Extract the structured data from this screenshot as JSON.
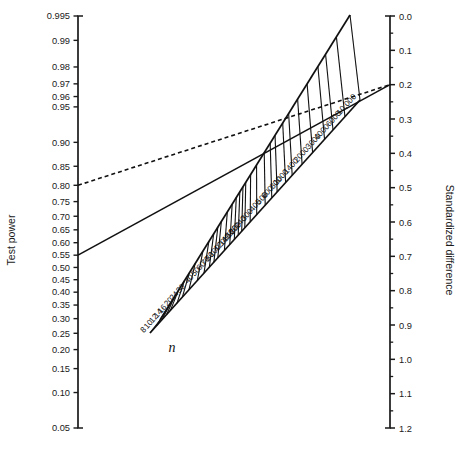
{
  "chart_data": {
    "type": "line",
    "title": "",
    "subtitle": "",
    "left_axis": {
      "label": "Test power",
      "tick_labels": [
        "0.995",
        "0.99",
        "0.98",
        "0.97",
        "0.96",
        "0.95",
        "0.90",
        "0.85",
        "0.80",
        "0.75",
        "0.70",
        "0.65",
        "0.60",
        "0.55",
        "0.50",
        "0.45",
        "0.40",
        "0.35",
        "0.30",
        "0.25",
        "0.20",
        "0.15",
        "0.10",
        "0.05"
      ],
      "tick_values": [
        0.995,
        0.99,
        0.98,
        0.97,
        0.96,
        0.95,
        0.9,
        0.85,
        0.8,
        0.75,
        0.7,
        0.65,
        0.6,
        0.55,
        0.5,
        0.45,
        0.4,
        0.35,
        0.3,
        0.25,
        0.2,
        0.15,
        0.1,
        0.05
      ],
      "range": [
        0.05,
        0.995
      ],
      "scale": "probit"
    },
    "right_axis": {
      "label": "Standardized difference",
      "tick_labels": [
        "0.0",
        "0.1",
        "0.2",
        "0.3",
        "0.4",
        "0.5",
        "0.6",
        "0.7",
        "0.8",
        "0.9",
        "1.0",
        "1.1",
        "1.2"
      ],
      "tick_values": [
        0.0,
        0.1,
        0.2,
        0.3,
        0.4,
        0.5,
        0.6,
        0.7,
        0.8,
        0.9,
        1.0,
        1.1,
        1.2
      ],
      "minor_tick_values": [
        0.05,
        0.15,
        0.25,
        0.35,
        0.45,
        0.55,
        0.65,
        0.75,
        0.85,
        0.95,
        1.05,
        1.15
      ],
      "range": [
        0.0,
        1.2
      ],
      "scale": "linear",
      "direction": "inverted"
    },
    "n_scale": {
      "label": "n",
      "tick_labels": [
        "8",
        "10",
        "12",
        "14",
        "16",
        "20",
        "24",
        "30",
        "40",
        "50",
        "60",
        "70",
        "80",
        "100",
        "120",
        "140",
        "160",
        "180",
        "200",
        "240",
        "300",
        "400",
        "500",
        "600",
        "800",
        "1000",
        "1400",
        "2000",
        "3000",
        "4000",
        "6000",
        "10,000"
      ],
      "tick_values": [
        8,
        10,
        12,
        14,
        16,
        20,
        24,
        30,
        40,
        50,
        60,
        70,
        80,
        100,
        120,
        140,
        160,
        180,
        200,
        240,
        300,
        400,
        500,
        600,
        800,
        1000,
        1400,
        2000,
        3000,
        4000,
        6000,
        10000
      ],
      "scale": "log",
      "orientation": "diagonal-ascending"
    },
    "series": [
      {
        "name": "dashed-reference-line",
        "style": "dashed",
        "color": "#111111",
        "start": {
          "axis": "left",
          "test_power": 0.8
        },
        "end": {
          "axis": "right",
          "standardized_difference": 0.2
        }
      },
      {
        "name": "solid-reference-line",
        "style": "solid",
        "color": "#111111",
        "start": {
          "axis": "left",
          "test_power": 0.55
        },
        "end": {
          "axis": "right",
          "standardized_difference": 0.2
        }
      }
    ],
    "grid": false,
    "legend": false
  },
  "caption": {
    "text": ""
  },
  "colors": {
    "ink": "#1a1a1a",
    "background": "#ffffff"
  }
}
